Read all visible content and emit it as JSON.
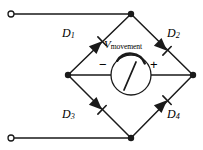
{
  "figure": {
    "type": "schematic-diagram",
    "background_color": "#ffffff",
    "line_color": "#1a1a1a"
  },
  "labels": {
    "d1": "D",
    "d1_sub": "1",
    "d2": "D",
    "d2_sub": "2",
    "d3": "D",
    "d3_sub": "3",
    "d4": "D",
    "d4_sub": "4",
    "v_symbol": "V",
    "v_subscript": "movement",
    "polarity_negative": "−",
    "polarity_positive": "+"
  },
  "nodes": {
    "top": {
      "x": 131,
      "y": 14
    },
    "left": {
      "x": 68,
      "y": 75
    },
    "right": {
      "x": 193,
      "y": 75
    },
    "bottom": {
      "x": 131,
      "y": 138
    }
  },
  "terminals": [
    {
      "name": "ac-input-top",
      "x": 12,
      "y": 14
    },
    {
      "name": "ac-input-bottom",
      "x": 12,
      "y": 138
    }
  ],
  "diodes": [
    {
      "name": "D1",
      "from": "left",
      "to": "top",
      "direction": "up-right",
      "cx": 97,
      "cy": 45
    },
    {
      "name": "D2",
      "from": "top",
      "to": "right",
      "direction": "down-right",
      "cx": 162,
      "cy": 45
    },
    {
      "name": "D3",
      "from": "left",
      "to": "bottom",
      "direction": "down-right",
      "cx": 97,
      "cy": 107
    },
    {
      "name": "D4",
      "from": "bottom",
      "to": "right",
      "direction": "up-right",
      "cx": 162,
      "cy": 107
    }
  ],
  "meter": {
    "name": "meter-movement",
    "cx": 131,
    "cy": 75,
    "radius": 20,
    "needle_angle_deg": 232,
    "scale_arc": "top"
  }
}
